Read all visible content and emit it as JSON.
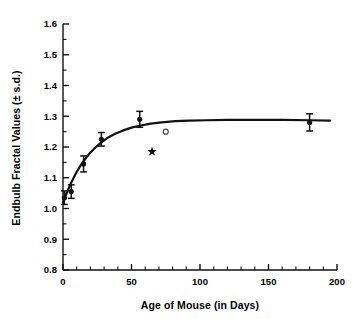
{
  "chart_data": {
    "type": "scatter",
    "title": "",
    "xlabel": "Age of Mouse (in Days)",
    "ylabel": "Endbulb Fractal Values (± s.d.)",
    "xlim": [
      0,
      200
    ],
    "ylim": [
      0.8,
      1.6
    ],
    "xticks": [
      0,
      50,
      100,
      150,
      200
    ],
    "xtick_labels": [
      "0",
      "50",
      "100",
      "150",
      "200"
    ],
    "x_minor_tick_step": 10,
    "yticks": [
      0.8,
      0.9,
      1.0,
      1.1,
      1.2,
      1.3,
      1.4,
      1.5,
      1.6
    ],
    "ytick_labels": [
      "0.8",
      "0.9",
      "1.0",
      "1.1",
      "1.2",
      "1.3",
      "1.4",
      "1.5",
      "1.6"
    ],
    "y_minor_tick_step": 0.05,
    "grid": false,
    "legend": "none",
    "series": [
      {
        "name": "Endbulb fractal value (mean ± s.d.)",
        "marker": "filled-circle",
        "color": "#111111",
        "has_error_bars": true,
        "x": [
          1,
          6,
          15,
          28,
          56,
          180
        ],
        "y": [
          1.035,
          1.055,
          1.145,
          1.225,
          1.29,
          1.28
        ],
        "yerr": [
          0.022,
          0.022,
          0.026,
          0.022,
          0.026,
          0.028
        ]
      },
      {
        "name": "Open circle marker",
        "marker": "open-circle",
        "color": "#444444",
        "has_error_bars": false,
        "x": [
          75
        ],
        "y": [
          1.25
        ]
      },
      {
        "name": "Star marker",
        "marker": "star",
        "color": "#111111",
        "has_error_bars": false,
        "x": [
          65
        ],
        "y": [
          1.185
        ]
      }
    ],
    "fit_curve": {
      "name": "Fitted asymptotic growth curve",
      "color": "#111111",
      "asymptote": 1.287,
      "x": [
        0,
        2,
        4,
        6,
        8,
        10,
        13,
        16,
        20,
        24,
        28,
        33,
        38,
        44,
        50,
        56,
        64,
        72,
        82,
        92,
        105,
        120,
        140,
        160,
        180,
        195
      ],
      "y": [
        1.018,
        1.042,
        1.064,
        1.084,
        1.102,
        1.119,
        1.141,
        1.16,
        1.182,
        1.2,
        1.215,
        1.231,
        1.243,
        1.254,
        1.263,
        1.269,
        1.276,
        1.28,
        1.284,
        1.286,
        1.287,
        1.288,
        1.288,
        1.288,
        1.287,
        1.286
      ]
    }
  }
}
